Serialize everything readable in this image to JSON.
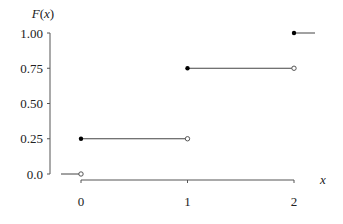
{
  "chart_data": {
    "type": "step",
    "title": "",
    "xlabel": "x",
    "ylabel": "F(x)",
    "ylabel_parts": {
      "func": "F",
      "open": "(",
      "var": "x",
      "close": ")"
    },
    "x_ticks": [
      0,
      1,
      2
    ],
    "x_tick_labels": [
      "0",
      "1",
      "2"
    ],
    "y_ticks": [
      0.0,
      0.25,
      0.5,
      0.75,
      1.0
    ],
    "y_tick_labels": [
      "0.0",
      "0.25",
      "0.50",
      "0.75",
      "1.00"
    ],
    "xlim": [
      -0.2,
      2.2
    ],
    "ylim": [
      0,
      1
    ],
    "grid": false,
    "legend": null,
    "segments": [
      {
        "x_start": -0.2,
        "x_end": 0,
        "y": 0.0,
        "left_closed": false,
        "right_open": true
      },
      {
        "x_start": 0,
        "x_end": 1,
        "y": 0.25,
        "left_closed": true,
        "right_open": true
      },
      {
        "x_start": 1,
        "x_end": 2,
        "y": 0.75,
        "left_closed": true,
        "right_open": true
      },
      {
        "x_start": 2,
        "x_end": 2.2,
        "y": 1.0,
        "left_closed": true,
        "right_open": false
      }
    ],
    "closed_points": [
      [
        0,
        0.25
      ],
      [
        1,
        0.75
      ],
      [
        2,
        1.0
      ]
    ],
    "open_points": [
      [
        0,
        0.0
      ],
      [
        1,
        0.25
      ],
      [
        2,
        0.75
      ]
    ]
  },
  "colors": {
    "line": "#444444",
    "axis": "#555555",
    "text": "#222222"
  }
}
